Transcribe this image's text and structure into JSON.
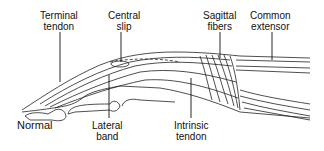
{
  "diagram": {
    "caption": "Normal",
    "labels": [
      {
        "id": "terminal-tendon",
        "line1": "Terminal",
        "line2": "tendon"
      },
      {
        "id": "central-slip",
        "line1": "Central",
        "line2": "slip"
      },
      {
        "id": "sagittal-fibers",
        "line1": "Sagittal",
        "line2": "fibers"
      },
      {
        "id": "common-extensor",
        "line1": "Common",
        "line2": "extensor"
      },
      {
        "id": "lateral-band",
        "line1": "Lateral",
        "line2": "band"
      },
      {
        "id": "intrinsic-tendon",
        "line1": "Intrinsic",
        "line2": "tendon"
      }
    ],
    "colors": {
      "ink": "#111111",
      "background": "#ffffff"
    }
  }
}
